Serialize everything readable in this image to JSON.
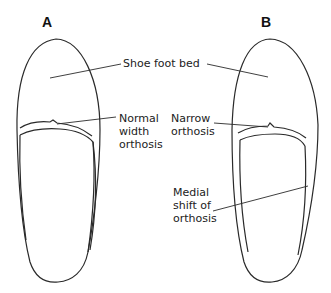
{
  "figure": {
    "panels": [
      {
        "id": "A",
        "label": "A"
      },
      {
        "id": "B",
        "label": "B"
      }
    ],
    "callouts": {
      "shoe_foot_bed": "Shoe foot bed",
      "normal_width_orthosis": [
        "Normal",
        "width",
        "orthosis"
      ],
      "narrow_orthosis": [
        "Narrow",
        "orthosis"
      ],
      "medial_shift": [
        "Medial",
        "shift of",
        "orthosis"
      ]
    },
    "colors": {
      "line": "#2a2a2a",
      "background": "#ffffff"
    }
  }
}
